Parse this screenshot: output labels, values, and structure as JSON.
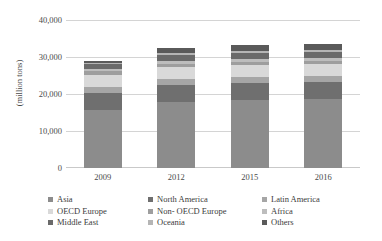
{
  "chart_data": {
    "type": "bar",
    "subtype": "stacked-vertical",
    "title": "",
    "xlabel": "",
    "ylabel": "(million tons)",
    "ylim": [
      0,
      40000
    ],
    "yticks": [
      0,
      10000,
      20000,
      30000,
      40000
    ],
    "ytick_labels": [
      "0",
      "10,000",
      "20,000",
      "30,000",
      "40,000"
    ],
    "categories": [
      "2009",
      "2012",
      "2015",
      "2016"
    ],
    "grid": true,
    "legend_position": "bottom",
    "series": [
      {
        "name": "Asia",
        "color": "#8c8c8c",
        "values": [
          15700,
          17800,
          18400,
          18600
        ]
      },
      {
        "name": "North America",
        "color": "#6f6f6f",
        "values": [
          4600,
          4700,
          4700,
          4700
        ]
      },
      {
        "name": "Latin America",
        "color": "#a6a6a6",
        "values": [
          1500,
          1600,
          1600,
          1600
        ]
      },
      {
        "name": "OECD Europe",
        "color": "#d9d9d9",
        "values": [
          3400,
          3200,
          3100,
          3100
        ]
      },
      {
        "name": "Non- OECD Europe",
        "color": "#9e9e9e",
        "values": [
          900,
          900,
          900,
          900
        ]
      },
      {
        "name": "Africa",
        "color": "#bdbdbd",
        "values": [
          700,
          800,
          800,
          800
        ]
      },
      {
        "name": "Middle East",
        "color": "#6a6a6a",
        "values": [
          1300,
          1600,
          1700,
          1700
        ]
      },
      {
        "name": "Oceania",
        "color": "#b5b5b5",
        "values": [
          400,
          400,
          400,
          400
        ]
      },
      {
        "name": "Others",
        "color": "#5a5a5a",
        "values": [
          500,
          1500,
          1600,
          1600
        ]
      }
    ],
    "totals": [
      29000,
      32500,
      33200,
      33400
    ]
  },
  "axis": {
    "y_title": "(million tons)"
  },
  "legend": {
    "columns": [
      [
        "Asia",
        "OECD Europe",
        "Middle East"
      ],
      [
        "North America",
        "Non- OECD Europe",
        "Oceania"
      ],
      [
        "Latin America",
        "Africa",
        "Others"
      ]
    ]
  },
  "colors": {
    "gridline": "#d4d4d4",
    "text": "#3b3b3b",
    "background": "#ffffff"
  }
}
